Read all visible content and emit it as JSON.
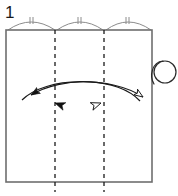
{
  "figure": {
    "step_number": "1",
    "colors": {
      "paper_outline": "#6e6e6e",
      "crease_dashed": "#1a1a1a",
      "arc_measure": "#8c8c8c",
      "arrow_stroke": "#1a1a1a",
      "arrowhead_solid_fill": "#111111",
      "arrowhead_hollow_fill": "#ffffff",
      "curl_stroke": "#2a2a2a",
      "background": "#ffffff",
      "label_text": "#1a1a1a"
    }
  },
  "paper": {
    "label": "paper sheet",
    "x": 6,
    "y": 30,
    "width": 146,
    "height": 152,
    "stroke_width": 1.6
  },
  "creases": [
    {
      "name": "crease-line-left",
      "x": 55,
      "y_top": 30,
      "y_bottom": 192,
      "dash": "4 4"
    },
    {
      "name": "crease-line-right",
      "x": 104,
      "y_top": 30,
      "y_bottom": 192,
      "dash": "4 4"
    }
  ],
  "measure_arcs": [
    {
      "name": "measure-arc-1",
      "x_start": 8,
      "x_end": 55,
      "peak_y": 20,
      "baseline_y": 30,
      "ticks": 2
    },
    {
      "name": "measure-arc-2",
      "x_start": 57,
      "x_end": 103,
      "peak_y": 20,
      "baseline_y": 30,
      "ticks": 2
    },
    {
      "name": "measure-arc-3",
      "x_start": 106,
      "x_end": 151,
      "peak_y": 20,
      "baseline_y": 30,
      "ticks": 2
    }
  ],
  "fold_arrows": [
    {
      "name": "fold-arrow-right-to-left",
      "style": "solid-head",
      "direction": "leftward",
      "path": "M 129 100 C 110 78, 60 78, 29 95",
      "head_tip": [
        22,
        99
      ],
      "head_angle_deg": 205
    },
    {
      "name": "fold-arrow-left-to-right",
      "style": "hollow-head",
      "direction": "rightward",
      "path": "M 27 100 C 48 78, 110 78, 144 97",
      "head_tip": [
        151,
        101
      ],
      "head_angle_deg": 332
    },
    {
      "name": "fold-arrow-inner-solid",
      "style": "solid-head",
      "direction": "leftward",
      "head_tip": [
        55,
        102
      ],
      "head_angle_deg": 205
    },
    {
      "name": "fold-arrow-inner-hollow",
      "style": "hollow-head",
      "direction": "rightward",
      "head_tip": [
        101,
        102
      ],
      "head_angle_deg": 332
    }
  ],
  "curl_symbol": {
    "name": "roll-curl-symbol",
    "center_x": 164,
    "center_y": 71,
    "radius": 11,
    "tail": "M 155 85 C 150 78, 152 64, 162 60"
  }
}
